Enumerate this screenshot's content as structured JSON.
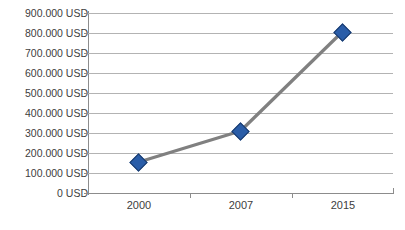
{
  "chart_data": {
    "type": "line",
    "title": "",
    "xlabel": "",
    "ylabel": "",
    "categories": [
      "2000",
      "2007",
      "2015"
    ],
    "values": [
      155000,
      310000,
      805000
    ],
    "series": [
      {
        "name": "USD",
        "values": [
          155000,
          310000,
          805000
        ]
      }
    ],
    "ylim": [
      0,
      900000
    ],
    "ytick_values": [
      900000,
      800000,
      700000,
      600000,
      500000,
      400000,
      300000,
      200000,
      100000,
      0
    ],
    "ytick_labels": [
      "900.000 USD",
      "800.000 USD",
      "700.000 USD",
      "600.000 USD",
      "500.000 USD",
      "400.000 USD",
      "300.000 USD",
      "200.000 USD",
      "100.000 USD",
      "0 USD"
    ],
    "xtick_labels": [
      "2000",
      "2007",
      "2015"
    ],
    "grid": true,
    "legend": false,
    "legend_position": "none",
    "marker": "diamond",
    "colors": {
      "marker_fill": "#2a5da8",
      "marker_edge": "#1b3c6e",
      "line": "#808080",
      "gridline": "#b3b3b3",
      "axis": "#8c8c8c",
      "tick_text": "#404040",
      "background": "#ffffff"
    }
  }
}
